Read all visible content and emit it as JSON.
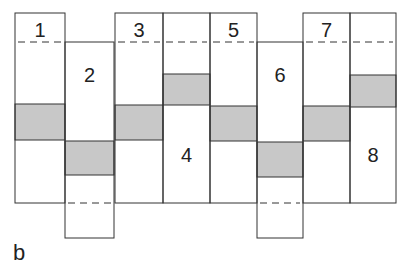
{
  "figure": {
    "panel_label": "b",
    "line_color": "#333333",
    "shade_color": "#c8c8c8",
    "columns": [
      {
        "number": "1",
        "x": 15,
        "w": 50,
        "top": 13,
        "bottom": 203,
        "shade": [
          104,
          140
        ],
        "dash_y": 42,
        "label_y": 37
      },
      {
        "number": "2",
        "x": 65,
        "w": 49,
        "top": 42,
        "bottom": 238,
        "shade": [
          141,
          175
        ],
        "dash_y": 203,
        "label_y": 82
      },
      {
        "number": "3",
        "x": 115,
        "w": 48,
        "top": 13,
        "bottom": 203,
        "shade": [
          105,
          140
        ],
        "dash_y": 42,
        "label_y": 37
      },
      {
        "number": "4",
        "x": 163,
        "w": 47,
        "top": 13,
        "bottom": 203,
        "shade": [
          74,
          105
        ],
        "dash_y": 42,
        "label_y": 162
      },
      {
        "number": "5",
        "x": 210,
        "w": 47,
        "top": 13,
        "bottom": 203,
        "shade": [
          106,
          141
        ],
        "dash_y": 42,
        "label_y": 37
      },
      {
        "number": "6",
        "x": 257,
        "w": 46,
        "top": 42,
        "bottom": 238,
        "shade": [
          142,
          177
        ],
        "dash_y": 203,
        "label_y": 82
      },
      {
        "number": "7",
        "x": 303,
        "w": 47,
        "top": 13,
        "bottom": 203,
        "shade": [
          106,
          141
        ],
        "dash_y": 42,
        "label_y": 37
      },
      {
        "number": "8",
        "x": 350,
        "w": 46,
        "top": 13,
        "bottom": 203,
        "shade": [
          75,
          107
        ],
        "dash_y": 42,
        "label_y": 162
      }
    ]
  }
}
